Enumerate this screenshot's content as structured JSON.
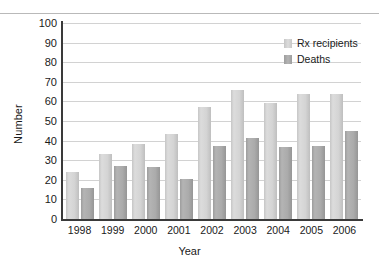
{
  "chart_data": {
    "type": "bar",
    "title": "",
    "xlabel": "Year",
    "ylabel": "Number",
    "categories": [
      "1998",
      "1999",
      "2000",
      "2001",
      "2002",
      "2003",
      "2004",
      "2005",
      "2006"
    ],
    "series": [
      {
        "name": "Rx recipients",
        "color": "#d4d4d4",
        "values": [
          24,
          33,
          38.5,
          43.5,
          57,
          66,
          59,
          64,
          64
        ]
      },
      {
        "name": "Deaths",
        "color": "#a8a8a8",
        "values": [
          16,
          27,
          26.5,
          20.5,
          37.5,
          41.5,
          36.5,
          37,
          45
        ]
      }
    ],
    "ylim": [
      0,
      100
    ],
    "yticks": [
      0,
      10,
      20,
      30,
      40,
      50,
      60,
      70,
      80,
      90,
      100
    ],
    "ytick_labels": [
      "0",
      "10",
      "20",
      "30",
      "40",
      "50",
      "60",
      "70",
      "80",
      "90",
      "100"
    ],
    "grid": true,
    "legend_position": "top-right"
  },
  "legend": {
    "entries": [
      {
        "label": "Rx recipients"
      },
      {
        "label": "Deaths"
      }
    ]
  },
  "axes": {
    "y_title": "Number",
    "x_title": "Year"
  }
}
